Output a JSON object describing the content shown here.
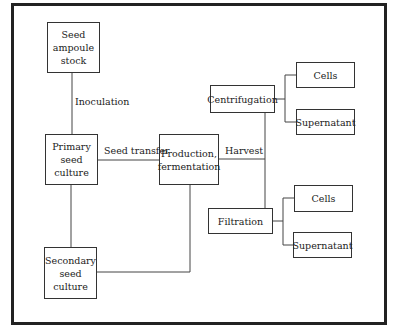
{
  "diagram": {
    "nodes": {
      "seed_stock": "Seed\nampoule\nstock",
      "primary": "Primary\nseed\nculture",
      "secondary": "Secondary\nseed\nculture",
      "production": "Production,\nfermentation",
      "centrifugation": "Centrifugation",
      "filtration": "Filtration",
      "centrifugation_cells": "Cells",
      "centrifugation_supernatant": "Supernatant",
      "filtration_cells": "Cells",
      "filtration_supernatant": "Supernatant"
    },
    "edge_labels": {
      "inoculation": "Inoculation",
      "seed_transfer": "Seed transfer",
      "harvest": "Harvest"
    },
    "edges": [
      {
        "from": "seed_stock",
        "to": "primary",
        "label": "Inoculation"
      },
      {
        "from": "primary",
        "to": "production",
        "label": "Seed transfer"
      },
      {
        "from": "primary",
        "to": "secondary",
        "label": ""
      },
      {
        "from": "secondary",
        "to": "production",
        "label": ""
      },
      {
        "from": "production",
        "to": "centrifugation",
        "label": "Harvest"
      },
      {
        "from": "production",
        "to": "filtration",
        "label": "Harvest"
      },
      {
        "from": "centrifugation",
        "to": "centrifugation_cells",
        "label": ""
      },
      {
        "from": "centrifugation",
        "to": "centrifugation_supernatant",
        "label": ""
      },
      {
        "from": "filtration",
        "to": "filtration_cells",
        "label": ""
      },
      {
        "from": "filtration",
        "to": "filtration_supernatant",
        "label": ""
      }
    ]
  }
}
